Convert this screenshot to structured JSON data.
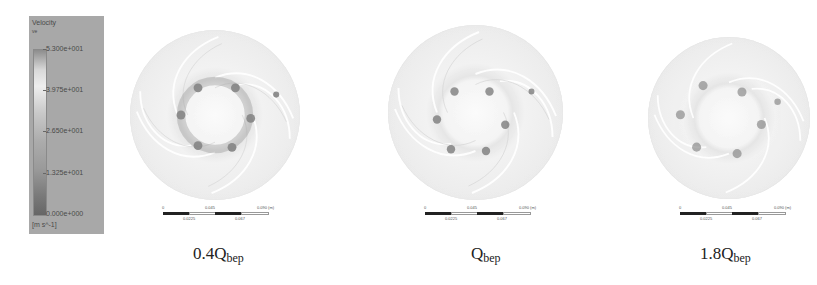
{
  "legend": {
    "title": "Velocity",
    "variable": "ve",
    "ticks": [
      "5.300e+001",
      "3.975e+001",
      "2.650e+001",
      "1.325e+001",
      "0.000e+000"
    ],
    "unit": "[m s^-1]",
    "max": 53.0,
    "min": 0.0
  },
  "scale_bar": {
    "top_labels": [
      "0",
      "0.045",
      "0.090 (m)"
    ],
    "bottom_labels": [
      "0.0225",
      "0.067"
    ]
  },
  "panels": [
    {
      "caption_main": "0.4Q",
      "caption_sub": "bep"
    },
    {
      "caption_main": "Q",
      "caption_sub": "bep"
    },
    {
      "caption_main": "1.8Q",
      "caption_sub": "bep"
    }
  ]
}
